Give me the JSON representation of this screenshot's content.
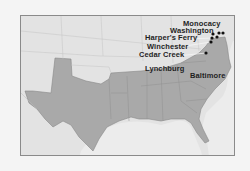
{
  "map": {
    "colors": {
      "background": "#f4f4f4",
      "land_other": "#e3e3e3",
      "confederacy": "#a9a9a9",
      "water": "#ececec",
      "border": "#8a8a8a",
      "marker": "#111111"
    },
    "labels": [
      {
        "id": "monocacy",
        "text": "Monocacy"
      },
      {
        "id": "washington",
        "text": "Washington"
      },
      {
        "id": "harpers-ferry",
        "text": "Harper's Ferry"
      },
      {
        "id": "winchester",
        "text": "Winchester"
      },
      {
        "id": "cedar-creek",
        "text": "Cedar Creek"
      },
      {
        "id": "lynchburg",
        "text": "Lynchburg"
      },
      {
        "id": "baltimore",
        "text": "Baltimore"
      }
    ]
  }
}
